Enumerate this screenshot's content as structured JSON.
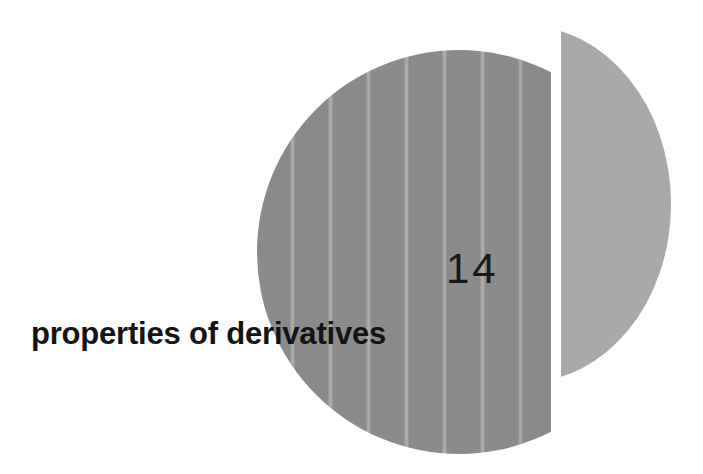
{
  "page": {
    "kind": "book-chapter-opening-page",
    "background_color": "#ffffff",
    "width": 703,
    "height": 474
  },
  "chapter": {
    "number": "14",
    "title": "properties of derivatives",
    "number_color": "#17181a",
    "title_color": "#141414"
  },
  "decoration": {
    "circle_dark": {
      "name": "striped-dark-circle",
      "fill_color": "#8b8b8b",
      "stripe_color": "#b2b2b2",
      "stripe_count": 8,
      "stripe_spacing_px": 38
    },
    "circle_light": {
      "name": "plain-light-circle",
      "fill_color": "#a9a9a9"
    },
    "gap_color": "#ffffff"
  }
}
